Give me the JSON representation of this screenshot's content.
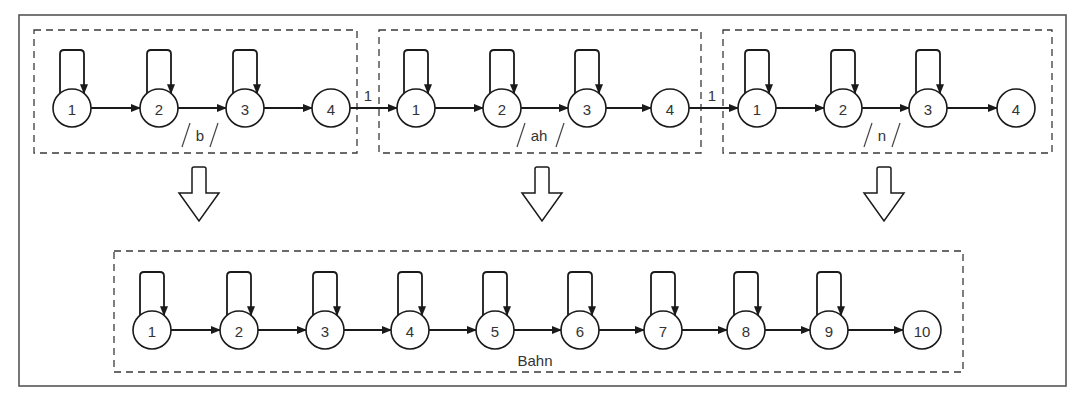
{
  "diagram": {
    "type": "hmm-concatenation",
    "frame": {
      "x": 19,
      "y": 15,
      "w": 1047,
      "h": 371
    },
    "node_radius": 19,
    "sub_models": [
      {
        "id": "b",
        "label": "b",
        "box": {
          "x": 34,
          "y": 30,
          "w": 323,
          "h": 123
        },
        "label_pos": {
          "x": 200,
          "y": 135
        },
        "label_slashes": [
          {
            "x": 186
          },
          {
            "x": 214
          }
        ],
        "nodes": [
          {
            "id": "1",
            "label": "1",
            "cx": 72,
            "cy": 108,
            "self_loop": true
          },
          {
            "id": "2",
            "label": "2",
            "cx": 159,
            "cy": 108,
            "self_loop": true
          },
          {
            "id": "3",
            "label": "3",
            "cx": 245,
            "cy": 108,
            "self_loop": true
          },
          {
            "id": "4",
            "label": "4",
            "cx": 331,
            "cy": 108,
            "self_loop": false
          }
        ]
      },
      {
        "id": "ah",
        "label": "ah",
        "box": {
          "x": 379,
          "y": 30,
          "w": 322,
          "h": 123
        },
        "label_pos": {
          "x": 539,
          "y": 135
        },
        "label_slashes": [
          {
            "x": 521
          },
          {
            "x": 560
          }
        ],
        "nodes": [
          {
            "id": "1",
            "label": "1",
            "cx": 416,
            "cy": 108,
            "self_loop": true
          },
          {
            "id": "2",
            "label": "2",
            "cx": 502,
            "cy": 108,
            "self_loop": true
          },
          {
            "id": "3",
            "label": "3",
            "cx": 587,
            "cy": 108,
            "self_loop": true
          },
          {
            "id": "4",
            "label": "4",
            "cx": 670,
            "cy": 108,
            "self_loop": false
          }
        ]
      },
      {
        "id": "n",
        "label": "n",
        "box": {
          "x": 723,
          "y": 30,
          "w": 329,
          "h": 123
        },
        "label_pos": {
          "x": 882,
          "y": 135
        },
        "label_slashes": [
          {
            "x": 868
          },
          {
            "x": 896
          }
        ],
        "nodes": [
          {
            "id": "1",
            "label": "1",
            "cx": 757,
            "cy": 108,
            "self_loop": true
          },
          {
            "id": "2",
            "label": "2",
            "cx": 843,
            "cy": 108,
            "self_loop": true
          },
          {
            "id": "3",
            "label": "3",
            "cx": 928,
            "cy": 108,
            "self_loop": true
          },
          {
            "id": "4",
            "label": "4",
            "cx": 1016,
            "cy": 108,
            "self_loop": false
          }
        ]
      }
    ],
    "inter_model_links": [
      {
        "from": "b.4",
        "to": "ah.1",
        "label": "1",
        "label_pos": {
          "x": 368,
          "y": 95
        }
      },
      {
        "from": "ah.4",
        "to": "n.1",
        "label": "1",
        "label_pos": {
          "x": 712,
          "y": 95
        }
      }
    ],
    "hollow_arrows": [
      {
        "cx": 199,
        "top": 167,
        "tip": 221
      },
      {
        "cx": 542,
        "top": 167,
        "tip": 221
      },
      {
        "cx": 884,
        "top": 167,
        "tip": 221
      }
    ],
    "combined_model": {
      "label": "Bahn",
      "box": {
        "x": 114,
        "y": 251,
        "w": 849,
        "h": 121
      },
      "label_pos": {
        "x": 535,
        "y": 360
      },
      "nodes": [
        {
          "id": "1",
          "label": "1",
          "cx": 152,
          "cy": 330,
          "self_loop": true
        },
        {
          "id": "2",
          "label": "2",
          "cx": 239,
          "cy": 330,
          "self_loop": true
        },
        {
          "id": "3",
          "label": "3",
          "cx": 325,
          "cy": 330,
          "self_loop": true
        },
        {
          "id": "4",
          "label": "4",
          "cx": 410,
          "cy": 330,
          "self_loop": true
        },
        {
          "id": "5",
          "label": "5",
          "cx": 495,
          "cy": 330,
          "self_loop": true
        },
        {
          "id": "6",
          "label": "6",
          "cx": 580,
          "cy": 330,
          "self_loop": true
        },
        {
          "id": "7",
          "label": "7",
          "cx": 663,
          "cy": 330,
          "self_loop": true
        },
        {
          "id": "8",
          "label": "8",
          "cx": 746,
          "cy": 330,
          "self_loop": true
        },
        {
          "id": "9",
          "label": "9",
          "cx": 829,
          "cy": 330,
          "self_loop": true
        },
        {
          "id": "10",
          "label": "10",
          "cx": 922,
          "cy": 330,
          "self_loop": false
        }
      ]
    }
  }
}
